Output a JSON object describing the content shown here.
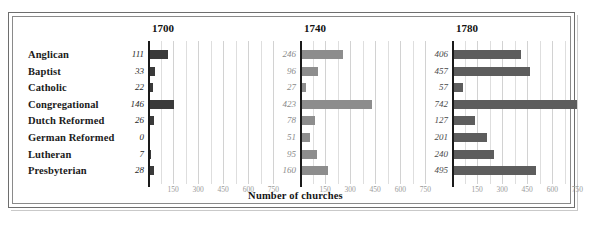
{
  "figure": {
    "caption": "Number of churches",
    "panel_titles": [
      "1700",
      "1740",
      "1780"
    ]
  },
  "chart_data": {
    "type": "bar",
    "orientation": "horizontal",
    "title": "",
    "xlabel": "Number of churches",
    "ylabel": "",
    "categories": [
      "Anglican",
      "Baptist",
      "Catholic",
      "Congregational",
      "Dutch Reformed",
      "German Reformed",
      "Lutheran",
      "Presbyterian"
    ],
    "panels": [
      {
        "name": "1700",
        "values": [
          111,
          33,
          22,
          146,
          26,
          0,
          7,
          28
        ],
        "bar_color": "#3a3a3a",
        "value_label_color": "#1f1f1f"
      },
      {
        "name": "1740",
        "values": [
          246,
          96,
          27,
          423,
          78,
          51,
          95,
          160
        ],
        "bar_color": "#8d8d8d",
        "value_label_color": "#8a8a8a"
      },
      {
        "name": "1780",
        "values": [
          406,
          457,
          57,
          742,
          127,
          201,
          240,
          495
        ],
        "bar_color": "#5d5d5d",
        "value_label_color": "#4a4a4a"
      }
    ],
    "xlim": [
      0,
      790
    ],
    "xticks": [
      150,
      300,
      450,
      600,
      750
    ],
    "xtick_labels": [
      "150",
      "300",
      "450",
      "600",
      "750"
    ],
    "minor_gridline_step": 75,
    "grid": true,
    "legend": "none"
  },
  "colors": {
    "frame": "#6e6e6e",
    "grid": "#dedede",
    "axis": "#1a1a1a",
    "tick_text": "#9a9a9a",
    "category_text": "#1b1b1b"
  }
}
